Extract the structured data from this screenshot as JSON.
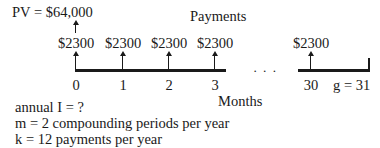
{
  "pv_label": "PV = $64,000",
  "payments_label": "Payments",
  "months_label": "Months",
  "ellipsis": "· · ·",
  "payments": [
    {
      "amount": "$2300",
      "period": "0"
    },
    {
      "amount": "$2300",
      "period": "1"
    },
    {
      "amount": "$2300",
      "period": "2"
    },
    {
      "amount": "$2300",
      "period": "3"
    },
    {
      "amount": "$2300",
      "period": "30"
    }
  ],
  "end_label": "g = 31",
  "notes": [
    "annual I = ?",
    "m = 2 compounding periods per year",
    "k = 12 payments per year"
  ]
}
